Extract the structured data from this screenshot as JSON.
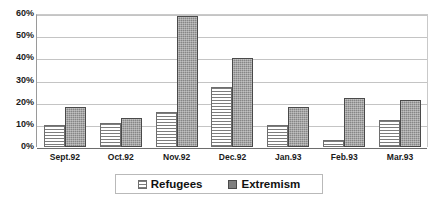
{
  "chart_data": {
    "type": "bar",
    "title": "",
    "xlabel": "",
    "ylabel": "",
    "ylim": [
      0,
      60
    ],
    "ytick_labels": [
      "60%",
      "50%",
      "40%",
      "30%",
      "20%",
      "10%",
      "0%"
    ],
    "ytick_values": [
      60,
      50,
      40,
      30,
      20,
      10,
      0
    ],
    "grid": true,
    "legend_position": "bottom",
    "categories": [
      "Sept.92",
      "Oct.92",
      "Nov.92",
      "Dec.92",
      "Jan.93",
      "Feb.93",
      "Mar.93"
    ],
    "series": [
      {
        "name": "Refugees",
        "swatch": "light-horizontal-hatch",
        "color": "#ffffff",
        "values": [
          10,
          11,
          16,
          27,
          10,
          3,
          12
        ]
      },
      {
        "name": "Extremism",
        "swatch": "dark-gray-stipple",
        "color": "#868686",
        "values": [
          18,
          13,
          59,
          40,
          18,
          22,
          21
        ]
      }
    ]
  },
  "legend": {
    "entries": [
      {
        "label": "Refugees"
      },
      {
        "label": "Extremism"
      }
    ]
  }
}
